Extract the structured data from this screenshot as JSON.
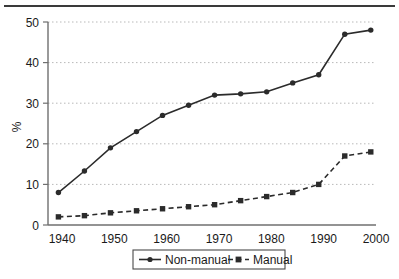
{
  "chart_data": {
    "type": "line",
    "title": "",
    "subtitle": "",
    "xlabel": "",
    "ylabel": "%",
    "x": [
      1940,
      1945,
      1950,
      1955,
      1960,
      1965,
      1970,
      1975,
      1980,
      1985,
      1990,
      1995,
      2000
    ],
    "xlim": [
      1938,
      2001
    ],
    "ylim": [
      0,
      50
    ],
    "ytick_labels": [
      "0",
      "10",
      "20",
      "30",
      "40",
      "50"
    ],
    "ytick_values": [
      0,
      10,
      20,
      30,
      40,
      50
    ],
    "xtick_labels": [
      "1940",
      "1950",
      "1960",
      "1970",
      "1980",
      "1990",
      "2000"
    ],
    "xtick_values": [
      1940,
      1950,
      1960,
      1970,
      1980,
      1990,
      2000
    ],
    "grid": "horizontal-dotted",
    "legend_position": "bottom-center",
    "series": [
      {
        "name": "Non-manual",
        "marker": "circle",
        "linestyle": "solid",
        "color": "#2b2b2b",
        "values": [
          8,
          13.3,
          19,
          23,
          27,
          29.5,
          32,
          32.3,
          32.8,
          35,
          37,
          47,
          48
        ]
      },
      {
        "name": "Manual",
        "marker": "square",
        "linestyle": "dashed",
        "color": "#2b2b2b",
        "values": [
          2,
          2.3,
          3,
          3.5,
          4,
          4.5,
          5,
          6,
          7,
          8,
          10,
          17,
          18
        ]
      }
    ]
  },
  "axes": {
    "y_axis_title": "%",
    "y_ticks": [
      {
        "label": "50",
        "value": 50
      },
      {
        "label": "40",
        "value": 40
      },
      {
        "label": "30",
        "value": 30
      },
      {
        "label": "20",
        "value": 20
      },
      {
        "label": "10",
        "value": 10
      },
      {
        "label": "0",
        "value": 0
      }
    ],
    "x_ticks": [
      {
        "label": "1940",
        "value": 1940
      },
      {
        "label": "1950",
        "value": 1950
      },
      {
        "label": "1960",
        "value": 1960
      },
      {
        "label": "1970",
        "value": 1970
      },
      {
        "label": "1980",
        "value": 1980
      },
      {
        "label": "1990",
        "value": 1990
      },
      {
        "label": "2000",
        "value": 2000
      }
    ]
  },
  "legend": {
    "entries": [
      {
        "label": "Non-manual",
        "marker": "circle",
        "linestyle": "solid"
      },
      {
        "label": "Manual",
        "marker": "square",
        "linestyle": "dashed"
      }
    ]
  },
  "colors": {
    "line": "#2b2b2b",
    "grid": "#b9b9b9",
    "axis": "#6f6f6f",
    "rule": "#3a3a3a",
    "text": "#1a1a1a"
  }
}
